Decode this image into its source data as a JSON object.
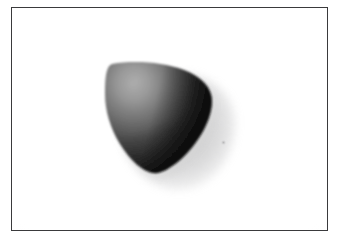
{
  "page": {
    "background_color": "#ffffff",
    "width": 340,
    "height": 243
  },
  "frame": {
    "name": "photo-frame",
    "border_color": "#3a3a3c",
    "border_width_px": 1.4,
    "left": 11,
    "top": 7,
    "width": 317,
    "height": 224,
    "fill_color": "#fefefe"
  },
  "photo": {
    "caption": "",
    "background_color": "#ffffff",
    "subject": {
      "name": "dark rounded-triangular object",
      "description": "smooth matte rounded triangle (guitar-pick / pebble shape) with a broad curved top and a rounded apex pointing down",
      "bounds": {
        "left": 108,
        "top": 62,
        "right": 212,
        "bottom": 172
      },
      "highlight_color": "#8f8f8f",
      "midtone_color": "#3f3f3f",
      "shadow_color": "#0d0d0d",
      "halo_color": "#d8d8d8",
      "light_direction": "upper-left"
    },
    "speck": {
      "name": "dust-speck",
      "x": 222,
      "y": 146,
      "color": "#b4b4b6"
    }
  }
}
